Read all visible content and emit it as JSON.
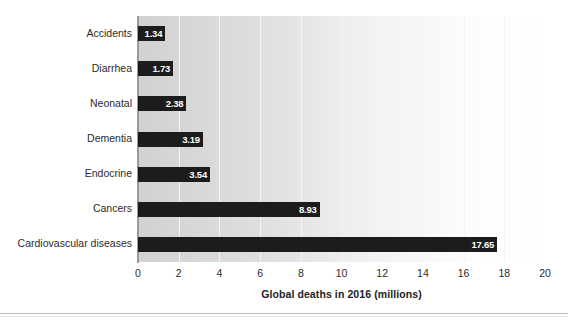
{
  "chart_data": {
    "type": "bar",
    "orientation": "horizontal",
    "title": "",
    "xlabel": "Global deaths in 2016 (millions)",
    "ylabel": "",
    "xlim": [
      0,
      20
    ],
    "xticks": [
      "0",
      "2",
      "4",
      "6",
      "8",
      "10",
      "12",
      "14",
      "16",
      "18",
      "20"
    ],
    "grid": "vertical",
    "legend": "none",
    "bar_color": "#1c1c1c",
    "plot_background": "#d2d2d2",
    "gridline_color": "#f4f4f4",
    "categories": [
      "Accidents",
      "Diarrhea",
      "Neonatal",
      "Dementia",
      "Endocrine",
      "Cancers",
      "Cardiovascular diseases"
    ],
    "values": [
      1.34,
      1.73,
      2.38,
      3.19,
      3.54,
      8.93,
      17.65
    ],
    "value_labels": [
      "1.34",
      "1.73",
      "2.38",
      "3.19",
      "3.54",
      "8.93",
      "17.65"
    ]
  }
}
